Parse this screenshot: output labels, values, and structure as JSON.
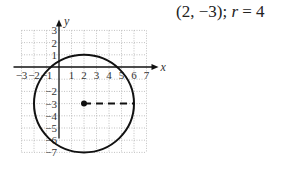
{
  "caption": {
    "center_text": "(2, −3);",
    "radius_var": "r",
    "radius_eq": " = 4"
  },
  "chart_data": {
    "type": "diagram",
    "xlabel": "x",
    "ylabel": "y",
    "x_ticks": [
      "-3",
      "-2",
      "-1",
      "1",
      "2",
      "3",
      "4",
      "5",
      "6",
      "7"
    ],
    "y_ticks": [
      "3",
      "2",
      "1",
      "-2",
      "-3",
      "-4",
      "-5",
      "-6",
      "-7"
    ],
    "xlim": [
      -3,
      7
    ],
    "ylim": [
      -7,
      3
    ],
    "grid": true,
    "circle": {
      "center": [
        2,
        -3
      ],
      "radius": 4
    },
    "radius_segment": {
      "from": [
        2,
        -3
      ],
      "to": [
        6,
        -3
      ],
      "style": "dashed"
    },
    "center_point": [
      2,
      -3
    ]
  }
}
